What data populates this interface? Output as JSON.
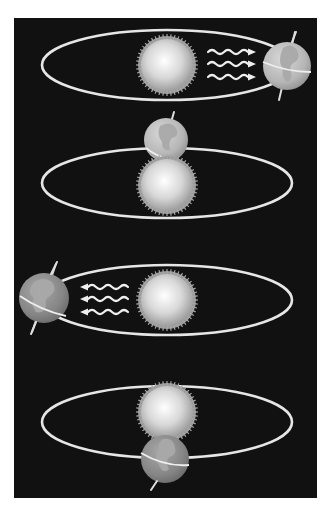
{
  "diagram": {
    "background": "#111111",
    "orbit_color": "#e6e6e6",
    "sun_color_center": "#ffffff",
    "sun_color_edge": "#9a9a9a",
    "earth_color": "#8a8a8a",
    "land_color": "#a9a9a9",
    "panels": [
      {
        "id": "scene-1",
        "earth_position": "right",
        "sunlight_rays": 3,
        "rays_direction": "toward-earth-right",
        "earth_axis_tilt": "toward-sun-top"
      },
      {
        "id": "scene-2",
        "earth_position": "back (behind sun)",
        "sunlight_rays": 0,
        "earth_axis_tilt": "tilted-right"
      },
      {
        "id": "scene-3",
        "earth_position": "left",
        "sunlight_rays": 3,
        "rays_direction": "toward-earth-left",
        "earth_axis_tilt": "away-from-sun-top"
      },
      {
        "id": "scene-4",
        "earth_position": "front (in front of sun)",
        "sunlight_rays": 0,
        "earth_axis_tilt": "tilted-left-bottom"
      }
    ]
  }
}
